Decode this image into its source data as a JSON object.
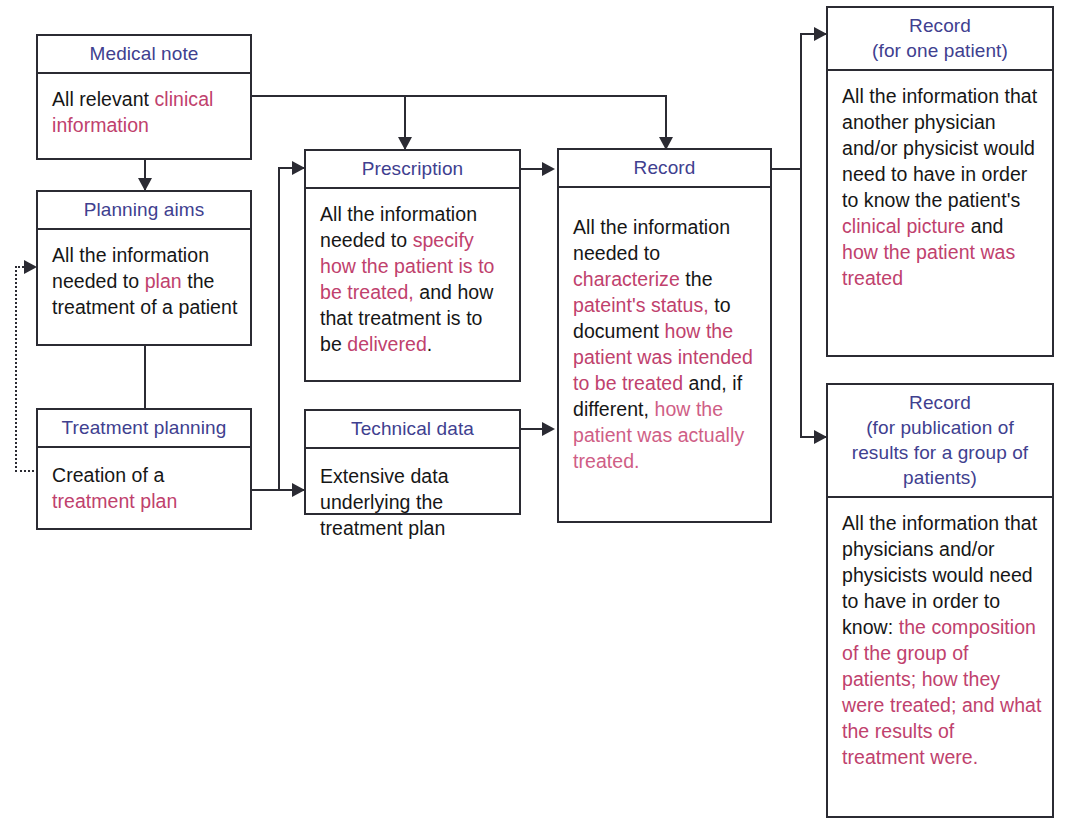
{
  "diagram": {
    "accent_header_color": "#40408f",
    "highlight_color": "#c0416d",
    "line_color": "#2b2b33"
  },
  "nodes": {
    "medical_note": {
      "header": "Medical note",
      "body_segments": [
        {
          "text": "All relevant ",
          "style": "plain"
        },
        {
          "text": "clinical information",
          "style": "highlight"
        }
      ]
    },
    "planning_aims": {
      "header": "Planning aims",
      "body_segments": [
        {
          "text": "All the information needed to ",
          "style": "plain"
        },
        {
          "text": "plan",
          "style": "highlight"
        },
        {
          "text": " the treatment of a patient",
          "style": "plain"
        }
      ]
    },
    "treatment_planning": {
      "header": "Treatment planning",
      "body_segments": [
        {
          "text": "Creation of a ",
          "style": "plain"
        },
        {
          "text": "treatment plan",
          "style": "highlight"
        }
      ]
    },
    "prescription": {
      "header": "Prescription",
      "body_segments": [
        {
          "text": "All the information needed to ",
          "style": "plain"
        },
        {
          "text": "specify how the patient is to be treated,",
          "style": "highlight"
        },
        {
          "text": " and how that treatment is to be ",
          "style": "plain"
        },
        {
          "text": "delivered",
          "style": "highlight"
        },
        {
          "text": ".",
          "style": "plain"
        }
      ]
    },
    "technical_data": {
      "header": "Technical data",
      "body_segments": [
        {
          "text": "Extensive data underlying the treatment plan",
          "style": "plain"
        }
      ]
    },
    "record": {
      "header": "Record",
      "body_segments": [
        {
          "text": "All the information needed to ",
          "style": "plain"
        },
        {
          "text": "characterize",
          "style": "highlight"
        },
        {
          "text": " the ",
          "style": "plain"
        },
        {
          "text": "pateint's status,",
          "style": "highlight"
        },
        {
          "text": " to document ",
          "style": "plain"
        },
        {
          "text": "how the patient was intended to be treated",
          "style": "highlight"
        },
        {
          "text": " and, if different, ",
          "style": "plain"
        },
        {
          "text": "how the patient was actually treated.",
          "style": "highlight-soft"
        }
      ]
    },
    "record_one_patient": {
      "header_line1": "Record",
      "header_line2": "(for one patient)",
      "body_segments": [
        {
          "text": "All the information that another physician and/or physicist would need to have in order to know the patient's ",
          "style": "plain"
        },
        {
          "text": "clinical picture",
          "style": "highlight"
        },
        {
          "text": " and ",
          "style": "plain"
        },
        {
          "text": "how the patient was treated",
          "style": "highlight"
        }
      ]
    },
    "record_group": {
      "header_line1": "Record",
      "header_line2": "(for publication of",
      "header_line3": "results for a group of",
      "header_line4": "patients)",
      "body_segments": [
        {
          "text": "All the information that physicians and/or physicists would need to have in order to know: ",
          "style": "plain"
        },
        {
          "text": "the composition of the group of patients; how they were treated; and what the results of treatment were.",
          "style": "highlight"
        }
      ]
    }
  },
  "edges": [
    {
      "name": "medical-note-to-planning-aims",
      "from": "medical_note",
      "to": "planning_aims",
      "style": "solid"
    },
    {
      "name": "medical-note-to-prescription",
      "from": "medical_note",
      "to": "prescription",
      "style": "solid"
    },
    {
      "name": "medical-note-to-record",
      "from": "medical_note",
      "to": "record",
      "style": "solid"
    },
    {
      "name": "planning-aims-to-treatment-planning",
      "from": "planning_aims",
      "to": "treatment_planning",
      "style": "solid"
    },
    {
      "name": "treatment-planning-to-planning-aims-feedback",
      "from": "treatment_planning",
      "to": "planning_aims",
      "style": "dotted"
    },
    {
      "name": "treatment-planning-to-prescription",
      "from": "treatment_planning",
      "to": "prescription",
      "style": "solid"
    },
    {
      "name": "treatment-planning-to-technical-data",
      "from": "treatment_planning",
      "to": "technical_data",
      "style": "solid"
    },
    {
      "name": "prescription-to-record",
      "from": "prescription",
      "to": "record",
      "style": "solid"
    },
    {
      "name": "technical-data-to-record",
      "from": "technical_data",
      "to": "record",
      "style": "solid"
    },
    {
      "name": "record-to-record-one-patient",
      "from": "record",
      "to": "record_one_patient",
      "style": "solid"
    },
    {
      "name": "record-to-record-group",
      "from": "record",
      "to": "record_group",
      "style": "solid"
    }
  ]
}
